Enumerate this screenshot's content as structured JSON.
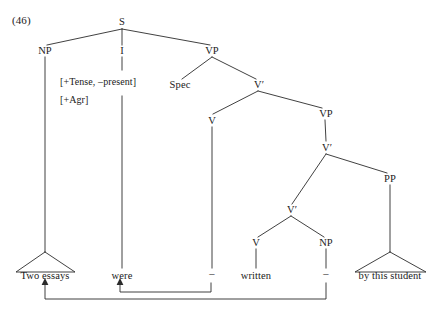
{
  "figure": {
    "example_number": "(46)",
    "type": "syntax-tree",
    "ink_color": "#2b2b2b",
    "background_color": "#ffffff"
  },
  "features": {
    "line1": "[+Tense, –present]",
    "line2": "[+Agr]"
  },
  "nodes": {
    "s": "S",
    "np_subject": "NP",
    "i": "I",
    "vp_top": "VP",
    "spec": "Spec",
    "vbar_top": "V′",
    "v_aux": "V",
    "vp_lower": "VP",
    "vbar_mid": "V′",
    "vbar_inner": "V′",
    "v_main": "V",
    "np_object": "NP",
    "pp": "PP"
  },
  "leaves": {
    "subject": "Two essays",
    "aux": "were",
    "trace_aux": "–",
    "participle": "written",
    "trace_object": "–",
    "pp_phrase": "by this student"
  },
  "movement": {
    "arrow_head_verb": "arrowhead-up",
    "arrow_head_subject": "arrowhead-up"
  }
}
